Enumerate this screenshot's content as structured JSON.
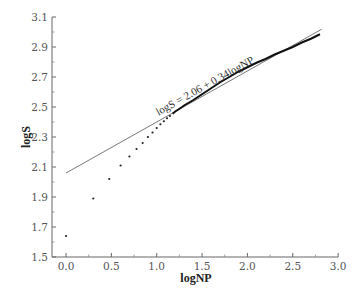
{
  "chart_data": {
    "type": "scatter",
    "title": "",
    "xlabel": "logNP",
    "ylabel": "logS",
    "xlim": [
      0.0,
      3.0
    ],
    "ylim": [
      1.5,
      3.1
    ],
    "xticks": [
      "0.0",
      "0.5",
      "1.0",
      "1.5",
      "2.0",
      "2.5",
      "3.0"
    ],
    "xtick_values": [
      0.0,
      0.5,
      1.0,
      1.5,
      2.0,
      2.5,
      3.0
    ],
    "yticks": [
      "1.5",
      "1.7",
      "1.9",
      "2.1",
      "2.3",
      "2.5",
      "2.7",
      "2.9",
      "3.1"
    ],
    "ytick_values": [
      1.5,
      1.7,
      1.9,
      2.1,
      2.3,
      2.5,
      2.7,
      2.9,
      3.1
    ],
    "grid": false,
    "legend": null,
    "annotation": {
      "text": "logS = 2.06 + 0.34logNP",
      "x": 1.55,
      "y": 2.62,
      "rotation_deg": -29
    },
    "fit_line": {
      "name": "logS = 2.06 + 0.34logNP",
      "intercept": 2.06,
      "slope": 0.34,
      "x_range": [
        0.0,
        2.82
      ]
    },
    "series": [
      {
        "name": "observed",
        "style": "dots-merging-into-thick-line",
        "x": [
          0.0,
          0.301,
          0.477,
          0.602,
          0.699,
          0.778,
          0.845,
          0.903,
          0.954,
          1.0,
          1.041,
          1.079,
          1.114,
          1.146,
          1.176,
          1.204,
          1.23,
          1.255,
          1.279,
          1.301,
          1.4,
          1.5,
          1.6,
          1.7,
          1.8,
          1.9,
          2.0,
          2.1,
          2.2,
          2.3,
          2.4,
          2.5,
          2.6,
          2.7,
          2.8
        ],
        "values": [
          1.64,
          1.89,
          2.02,
          2.11,
          2.17,
          2.22,
          2.26,
          2.3,
          2.33,
          2.36,
          2.385,
          2.405,
          2.425,
          2.44,
          2.455,
          2.47,
          2.48,
          2.49,
          2.5,
          2.51,
          2.545,
          2.585,
          2.625,
          2.665,
          2.7,
          2.735,
          2.765,
          2.795,
          2.82,
          2.85,
          2.875,
          2.9,
          2.93,
          2.955,
          2.985
        ]
      }
    ]
  }
}
